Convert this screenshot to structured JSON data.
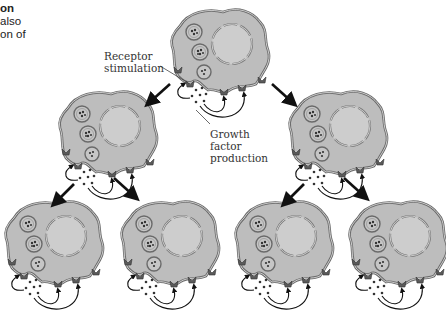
{
  "caption": {
    "lines": [
      "on",
      " also",
      "on of"
    ]
  },
  "labels": {
    "receptor": [
      "Receptor",
      "stimulation"
    ],
    "growth": [
      "Growth",
      "factor",
      "production"
    ]
  },
  "colors": {
    "cell_fill": "#bdbdbd",
    "membrane": "#6e6e6e",
    "nucleus_fill": "#cfcfcf",
    "vesicle_fill": "#c8c8c8",
    "dot": "#333333",
    "arrow": "#111111",
    "receptor": "#555555"
  },
  "cells": [
    {
      "id": "top",
      "level": 0
    },
    {
      "id": "mid-left",
      "level": 1
    },
    {
      "id": "mid-right",
      "level": 1
    },
    {
      "id": "bottom-1",
      "level": 2
    },
    {
      "id": "bottom-2",
      "level": 2
    },
    {
      "id": "bottom-3",
      "level": 2
    },
    {
      "id": "bottom-4",
      "level": 2
    }
  ]
}
